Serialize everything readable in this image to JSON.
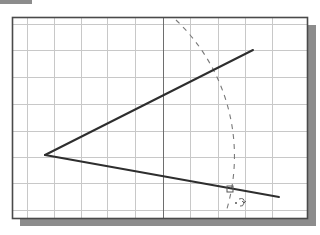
{
  "figure": {
    "colors": {
      "background": "#ffffff",
      "grid": "#c8c8c8",
      "axis": "#6e6e6e",
      "frame": "#4a4a4a",
      "shadow": "#8c8c8c",
      "line": "#2e2e2e",
      "arc": "#7a7a7a"
    },
    "frame": {
      "x": 12,
      "y": 17,
      "width": 295,
      "height": 201
    },
    "grid": {
      "vertical_x": [
        27,
        54,
        81,
        107,
        135,
        190,
        218,
        245,
        272
      ],
      "horizontal_y": [
        24,
        50,
        77,
        104,
        131,
        157,
        183,
        210
      ],
      "axis_x": 163
    },
    "vertex": {
      "x": 45,
      "y": 155
    },
    "lines": [
      {
        "name": "upper-line",
        "x1": 45,
        "y1": 155,
        "x2": 253,
        "y2": 50
      },
      {
        "name": "lower-line",
        "x1": 45,
        "y1": 155,
        "x2": 279,
        "y2": 197
      }
    ],
    "arc": {
      "cx": 45,
      "cy": 155,
      "r": 188,
      "start": {
        "x": 176,
        "y": 20
      },
      "end": {
        "x": 226,
        "y": 212
      }
    },
    "snap_marker": {
      "x": 230,
      "y": 189,
      "size": 6
    },
    "rotate_cursor": {
      "x": 240,
      "y": 202
    }
  }
}
